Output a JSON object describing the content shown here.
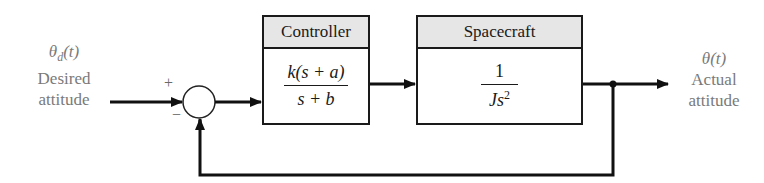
{
  "diagram": {
    "type": "feedback-control-block-diagram",
    "input": {
      "symbol": "θ",
      "subscript": "d",
      "arg": "(t)",
      "line1": "Desired",
      "line2": "attitude"
    },
    "output": {
      "symbol": "θ",
      "arg": "(t)",
      "line1": "Actual",
      "line2": "attitude"
    },
    "summing_junction": {
      "plus_sign": "+",
      "minus_sign": "−"
    },
    "blocks": [
      {
        "title": "Controller",
        "numerator": "k(s + a)",
        "denominator": "s + b"
      },
      {
        "title": "Spacecraft",
        "numerator": "1",
        "denominator_base": "Js",
        "denominator_exp": "2"
      }
    ],
    "colors": {
      "line": "#1a1a1a",
      "header_fill": "#e6e6e6",
      "label_text": "#7a7a7a"
    }
  }
}
